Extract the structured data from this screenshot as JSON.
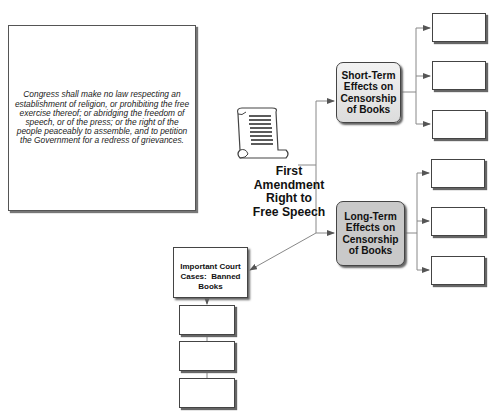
{
  "quote": {
    "text": "Congress shall make no law respecting an establishment of religion, or prohibiting the free exercise thereof; or abridging the freedom of speech, or of the press; or the right of the people peaceably to assemble, and to petition the Government for a redress of grievances."
  },
  "center": {
    "icon": "scroll-icon",
    "title_lines": [
      "First",
      "Amendment",
      "Right to",
      "Free Speech"
    ]
  },
  "short_term": {
    "lines": [
      "Short-Term",
      "Effects on",
      "Censorship",
      "of Books"
    ],
    "children": [
      "",
      "",
      ""
    ]
  },
  "long_term": {
    "lines": [
      "Long-Term",
      "Effects on",
      "Censorship",
      "of Books"
    ],
    "children": [
      "",
      "",
      ""
    ]
  },
  "court_cases": {
    "lines": [
      "Important Court",
      "Cases:  Banned",
      "Books"
    ],
    "children": [
      "",
      "",
      ""
    ]
  },
  "colors": {
    "line": "#777777",
    "short_fill": "#e6e6e6",
    "long_fill": "#c9c9c9"
  }
}
